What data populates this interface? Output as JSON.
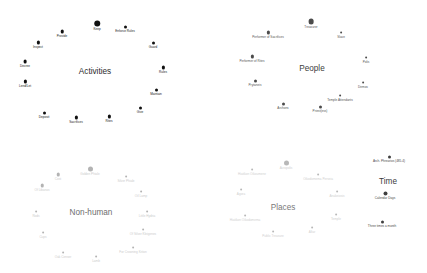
{
  "figure": {
    "background": "#ffffff",
    "width": 427,
    "height": 273,
    "type": "scatter"
  },
  "chart_data": {
    "type": "scatter",
    "title": "",
    "xlabel": "",
    "ylabel": "",
    "grid": false,
    "legend": "none",
    "xlim": [
      0,
      427
    ],
    "ylim": [
      0,
      273
    ],
    "clusters": [
      {
        "name": "Activities",
        "title": "Activities",
        "color": "#111111",
        "label_color": "#1a1a1a",
        "center": [
          95,
          71
        ],
        "nodes": [
          {
            "label": "Keep",
            "x": 97,
            "y": 24,
            "size": 5.2
          },
          {
            "label": "Enforce Rules",
            "x": 125,
            "y": 27,
            "size": 2.4
          },
          {
            "label": "Guard",
            "x": 153,
            "y": 43,
            "size": 2.4
          },
          {
            "label": "Rules",
            "x": 163,
            "y": 68,
            "size": 2.6
          },
          {
            "label": "Maintain",
            "x": 156,
            "y": 90,
            "size": 2.4
          },
          {
            "label": "Give",
            "x": 140,
            "y": 108,
            "size": 2.4
          },
          {
            "label": "Rites",
            "x": 109,
            "y": 117,
            "size": 2.6
          },
          {
            "label": "Sacrifices",
            "x": 76,
            "y": 118,
            "size": 2.6
          },
          {
            "label": "Deposit",
            "x": 44,
            "y": 113,
            "size": 2.4
          },
          {
            "label": "Lend/Let",
            "x": 25,
            "y": 82,
            "size": 2.6
          },
          {
            "label": "Decree",
            "x": 25,
            "y": 62,
            "size": 3.0
          },
          {
            "label": "Inspect",
            "x": 38,
            "y": 43,
            "size": 2.6
          },
          {
            "label": "Provide",
            "x": 62,
            "y": 32,
            "size": 2.8
          }
        ]
      },
      {
        "name": "People",
        "title": "People",
        "color": "#4b4b4b",
        "label_color": "#555555",
        "center": [
          312,
          68
        ],
        "nodes": [
          {
            "label": "Treasurer",
            "x": 311,
            "y": 22,
            "size": 4.6
          },
          {
            "label": "Slave",
            "x": 341,
            "y": 33,
            "size": 2.2
          },
          {
            "label": "Polis",
            "x": 366,
            "y": 58,
            "size": 2.2
          },
          {
            "label": "Demos",
            "x": 363,
            "y": 83,
            "size": 2.2
          },
          {
            "label": "Temple Attendants",
            "x": 340,
            "y": 96,
            "size": 2.2
          },
          {
            "label": "Priest(ess)",
            "x": 320,
            "y": 107,
            "size": 2.4
          },
          {
            "label": "Archons",
            "x": 283,
            "y": 104,
            "size": 2.4
          },
          {
            "label": "Prytaneis",
            "x": 255,
            "y": 81,
            "size": 2.4
          },
          {
            "label": "Performer of Rites",
            "x": 252,
            "y": 57,
            "size": 2.6
          },
          {
            "label": "Performer of Sacrifices",
            "x": 268,
            "y": 33,
            "size": 2.6
          }
        ]
      },
      {
        "name": "Time",
        "title": "Time",
        "color": "#3f3f3f",
        "label_color": "#4a4a4a",
        "center": [
          388,
          181
        ],
        "nodes": [
          {
            "label": "Arch. Phrearios (485-4)",
            "x": 389,
            "y": 157,
            "size": 2.4
          },
          {
            "label": "Calendar Days",
            "x": 385,
            "y": 194,
            "size": 3.2
          },
          {
            "label": "Three times a month",
            "x": 382,
            "y": 222,
            "size": 2.4
          }
        ]
      },
      {
        "name": "Non-human",
        "title": "Non-human",
        "color": "#b3b3b3",
        "label_color": "#cccccc",
        "center": [
          91,
          212
        ],
        "nodes": [
          {
            "label": "Golden Phiale",
            "x": 90,
            "y": 169,
            "size": 4.0
          },
          {
            "label": "Silver Phiale",
            "x": 126,
            "y": 177,
            "size": 2.2
          },
          {
            "label": "Oil Lamp",
            "x": 141,
            "y": 192,
            "size": 2.2
          },
          {
            "label": "Little Hydria",
            "x": 147,
            "y": 212,
            "size": 2.2
          },
          {
            "label": "Of Silver Kleigenes",
            "x": 143,
            "y": 230,
            "size": 2.2
          },
          {
            "label": "For Crowning Kriton",
            "x": 133,
            "y": 248,
            "size": 2.2
          },
          {
            "label": "Lamb",
            "x": 96,
            "y": 257,
            "size": 2.2
          },
          {
            "label": "Oak Censer",
            "x": 63,
            "y": 253,
            "size": 2.2
          },
          {
            "label": "Cups",
            "x": 43,
            "y": 233,
            "size": 2.2
          },
          {
            "label": "Rods",
            "x": 36,
            "y": 212,
            "size": 2.2
          },
          {
            "label": "Of Libanos",
            "x": 42,
            "y": 186,
            "size": 2.8
          },
          {
            "label": "Cost",
            "x": 58,
            "y": 175,
            "size": 2.8
          }
        ]
      },
      {
        "name": "Places",
        "title": "Places",
        "color": "#b8b8b8",
        "label_color": "#d0d0d0",
        "center": [
          283,
          207
        ],
        "nodes": [
          {
            "label": "Acropolis",
            "x": 286,
            "y": 163,
            "size": 4.0
          },
          {
            "label": "Oikodomema Perseia",
            "x": 318,
            "y": 175,
            "size": 2.2
          },
          {
            "label": "Anakeiosis",
            "x": 337,
            "y": 192,
            "size": 2.2
          },
          {
            "label": "Temple",
            "x": 336,
            "y": 215,
            "size": 2.2
          },
          {
            "label": "Altar",
            "x": 312,
            "y": 228,
            "size": 2.2
          },
          {
            "label": "Public Treasure",
            "x": 273,
            "y": 232,
            "size": 2.2
          },
          {
            "label": "Hiatikon Oikodomema",
            "x": 245,
            "y": 216,
            "size": 2.2
          },
          {
            "label": "Agora",
            "x": 241,
            "y": 190,
            "size": 2.2
          },
          {
            "label": "Hiatikon Oikoumene",
            "x": 252,
            "y": 170,
            "size": 2.2
          }
        ]
      }
    ]
  }
}
